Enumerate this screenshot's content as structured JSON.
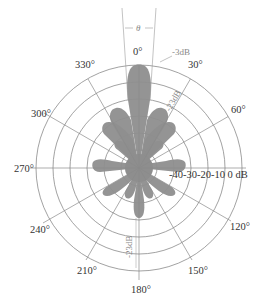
{
  "diagram": {
    "type": "polar radiation pattern",
    "center": [
      139,
      168
    ],
    "outer_radius": 103,
    "ring_db_levels": [
      0,
      -10,
      -20,
      -30,
      -40
    ],
    "angle_labels": [
      {
        "angle": 0,
        "text": "0°"
      },
      {
        "angle": 30,
        "text": "30°"
      },
      {
        "angle": 60,
        "text": "60°"
      },
      {
        "angle": 90,
        "text": "90°"
      },
      {
        "angle": 120,
        "text": "120°"
      },
      {
        "angle": 150,
        "text": "150°"
      },
      {
        "angle": 180,
        "text": "180°"
      },
      {
        "angle": 210,
        "text": "210°"
      },
      {
        "angle": 240,
        "text": "240°"
      },
      {
        "angle": 270,
        "text": "270°"
      },
      {
        "angle": 300,
        "text": "300°"
      },
      {
        "angle": 330,
        "text": "330°"
      }
    ],
    "db_scale_label": "-40-30-20-10 0 dB",
    "annotations": {
      "beamwidth": "θ",
      "half_power": "-3dB",
      "side_lobe": "-23dB",
      "back_lobe": "-23dB"
    },
    "colors": {
      "lobe": "#8e8e8e",
      "grid": "#8a8a8a",
      "text": "#333333",
      "annotation": "#888888"
    }
  },
  "labels": {
    "a0": "0°",
    "a30": "30°",
    "a60": "60°",
    "a120": "120°",
    "a150": "150°",
    "a180": "180°",
    "a210": "210°",
    "a240": "240°",
    "a270": "270°",
    "a300": "300°",
    "a330": "330°",
    "db_scale": "-40-30-20-10 0 dB",
    "theta": "θ",
    "minus3db": "-3dB",
    "side_lobe_db": "-23dB",
    "back_lobe_db": "-23dB"
  }
}
